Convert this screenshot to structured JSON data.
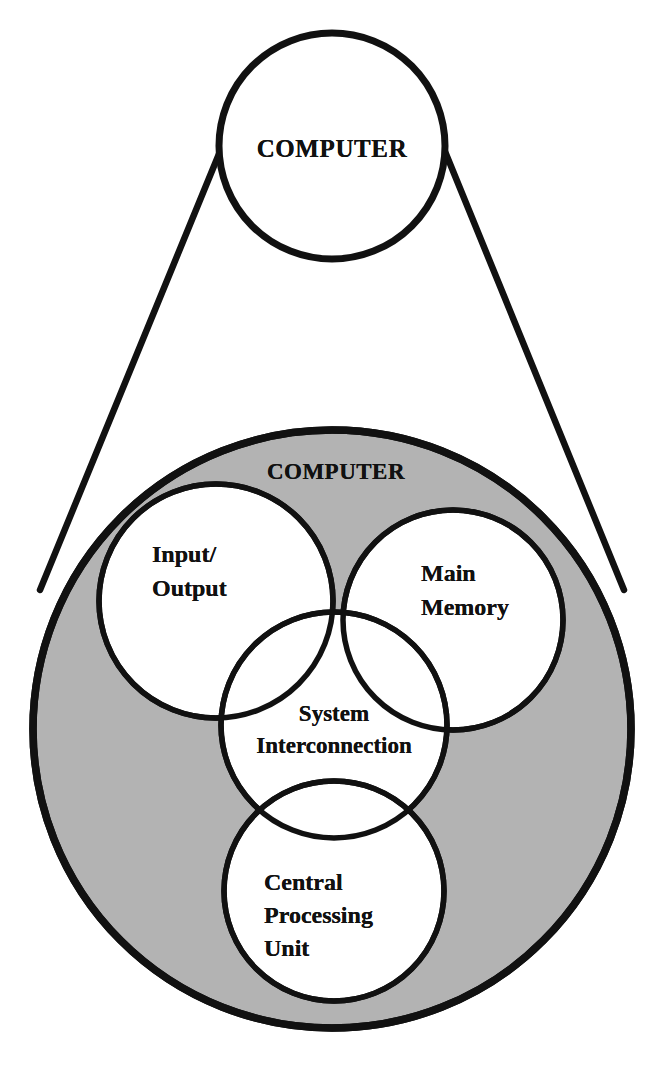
{
  "diagram": {
    "colors": {
      "stroke": "#111111",
      "shaded_fill": "#b3b3b3",
      "disc_fill": "#ffffff",
      "background": "#ffffff"
    },
    "overview": {
      "label": "COMPUTER",
      "shape": "circle",
      "fill": "white"
    },
    "detail": {
      "label": "COMPUTER",
      "shape": "circle",
      "fill": "shaded",
      "components": [
        {
          "id": "io",
          "lines": [
            "Input/",
            "Output"
          ],
          "line1": "Input/",
          "line2": "Output",
          "shape": "circle",
          "fill": "white"
        },
        {
          "id": "main-memory",
          "lines": [
            "Main",
            "Memory"
          ],
          "line1": "Main",
          "line2": "Memory",
          "shape": "circle",
          "fill": "white"
        },
        {
          "id": "system-interconnection",
          "lines": [
            "System",
            "Interconnection"
          ],
          "line1": "System",
          "line2": "Interconnection",
          "shape": "circle",
          "fill": "white"
        },
        {
          "id": "cpu",
          "lines": [
            "Central",
            "Processing",
            "Unit"
          ],
          "line1": "Central",
          "line2": "Processing",
          "line3": "Unit",
          "shape": "circle",
          "fill": "white"
        }
      ]
    },
    "connector": {
      "type": "magnifier-cone",
      "description": "two straight lines joining the small COMPUTER circle to the enlarged shaded COMPUTER circle"
    }
  }
}
